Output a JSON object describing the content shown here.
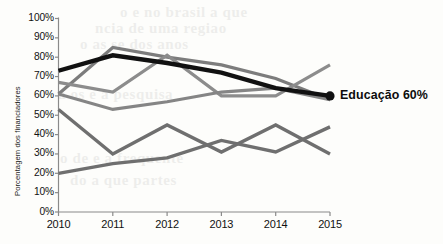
{
  "chart_data": {
    "type": "line",
    "title": "",
    "xlabel": "",
    "ylabel": "Porcentagem dos financiadores",
    "x": [
      2010,
      2011,
      2012,
      2013,
      2014,
      2015
    ],
    "xtick_labels": [
      "2010",
      "2011",
      "2012",
      "2013",
      "2014",
      "2015"
    ],
    "ytick_labels": [
      "100%",
      "90%",
      "80%",
      "70%",
      "60%",
      "50%",
      "40%",
      "30%",
      "20%",
      "10%",
      "0%"
    ],
    "ytick_values": [
      100,
      90,
      80,
      70,
      60,
      50,
      40,
      30,
      20,
      10,
      0
    ],
    "ylim": [
      0,
      100
    ],
    "xlim": [
      2010,
      2015
    ],
    "grid": false,
    "legend_position": "inline-end-of-line",
    "series": [
      {
        "name": "Educação",
        "values": [
          73,
          81,
          77,
          72,
          64,
          60
        ],
        "color": "#111111",
        "width": 4.4,
        "emphasis": true,
        "end_marker": true,
        "end_label": "Educação 60%"
      },
      {
        "name": "serie-2",
        "values": [
          61,
          85,
          80,
          76,
          69,
          58
        ],
        "color": "#7c7c7c",
        "width": 3.2,
        "emphasis": false,
        "end_marker": false,
        "end_label": ""
      },
      {
        "name": "serie-3",
        "values": [
          67,
          62,
          81,
          60,
          60,
          76
        ],
        "color": "#8c8c8c",
        "width": 3.2,
        "emphasis": false,
        "end_marker": false,
        "end_label": ""
      },
      {
        "name": "serie-4",
        "values": [
          61,
          53,
          57,
          62,
          64,
          58
        ],
        "color": "#858585",
        "width": 3.2,
        "emphasis": false,
        "end_marker": false,
        "end_label": ""
      },
      {
        "name": "serie-5",
        "values": [
          53,
          30,
          45,
          31,
          45,
          30
        ],
        "color": "#6f6f6f",
        "width": 3.4,
        "emphasis": false,
        "end_marker": false,
        "end_label": ""
      },
      {
        "name": "serie-6",
        "values": [
          20,
          25,
          28,
          37,
          31,
          44
        ],
        "color": "#6f6f6f",
        "width": 3.4,
        "emphasis": false,
        "end_marker": false,
        "end_label": ""
      }
    ],
    "annotations": [
      {
        "text": "Educação 60%",
        "series": "Educação",
        "x": 2015,
        "y": 60
      }
    ],
    "axis_color": "#8a8a8a",
    "text_color": "#111111",
    "background": "#fdfdfb"
  },
  "bleed_text": [
    "o e no brasil  a  que",
    "ncia de  uma  regiao",
    "o  as  se  dos  anos",
    "a  os  e  a  pesquisa",
    "o de  e  a  frequente",
    "do  a  que  partes"
  ]
}
